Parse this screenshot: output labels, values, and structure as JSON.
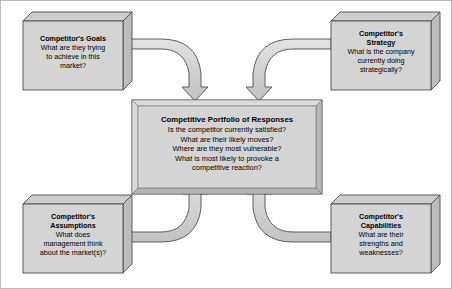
{
  "diagram": {
    "colors": {
      "box_face": "#d4d4d4",
      "box_top": "#cccccc",
      "box_side": "#bdbdbd",
      "arrow_fill": "#cfcfcf",
      "arrow_fill_light": "#dcdcdc",
      "stroke": "#4d4d4d",
      "text": "#000000",
      "background": "#ffffff",
      "canvas_border": "#b9b9b9"
    },
    "center": {
      "title": "Competitive Portfolio of Responses",
      "lines": [
        "Is the competitor currently satisfied?",
        "What are their likely moves?",
        "Where are they most vulnerable?",
        "What is most likely to provoke a",
        "competitive reaction?"
      ]
    },
    "nodes": [
      {
        "id": "goals",
        "position": "top-left",
        "title_lines": [
          "Competitor's Goals"
        ],
        "lines": [
          "What are they trying",
          "to achieve in this",
          "market?"
        ]
      },
      {
        "id": "strategy",
        "position": "top-right",
        "title_lines": [
          "Competitor's",
          "Strategy"
        ],
        "lines": [
          "What is the company",
          "currently doing",
          "strategically?"
        ]
      },
      {
        "id": "assumptions",
        "position": "bottom-left",
        "title_lines": [
          "Competitor's",
          "Assumptions"
        ],
        "lines": [
          "What does",
          "management think",
          "about the market(s)?"
        ]
      },
      {
        "id": "capabilities",
        "position": "bottom-right",
        "title_lines": [
          "Competitor's",
          "Capabilities"
        ],
        "lines": [
          "What are their",
          "strengths and",
          "weaknesses?"
        ]
      }
    ],
    "arrows": [
      {
        "id": "goals-to-center",
        "from": "goals",
        "to": "center",
        "style": "curved-ribbon"
      },
      {
        "id": "strategy-to-center",
        "from": "strategy",
        "to": "center",
        "style": "curved-ribbon"
      },
      {
        "id": "assumptions-to-center",
        "from": "assumptions",
        "to": "center",
        "style": "curved-ribbon"
      },
      {
        "id": "capabilities-to-center",
        "from": "capabilities",
        "to": "center",
        "style": "curved-ribbon"
      }
    ]
  }
}
